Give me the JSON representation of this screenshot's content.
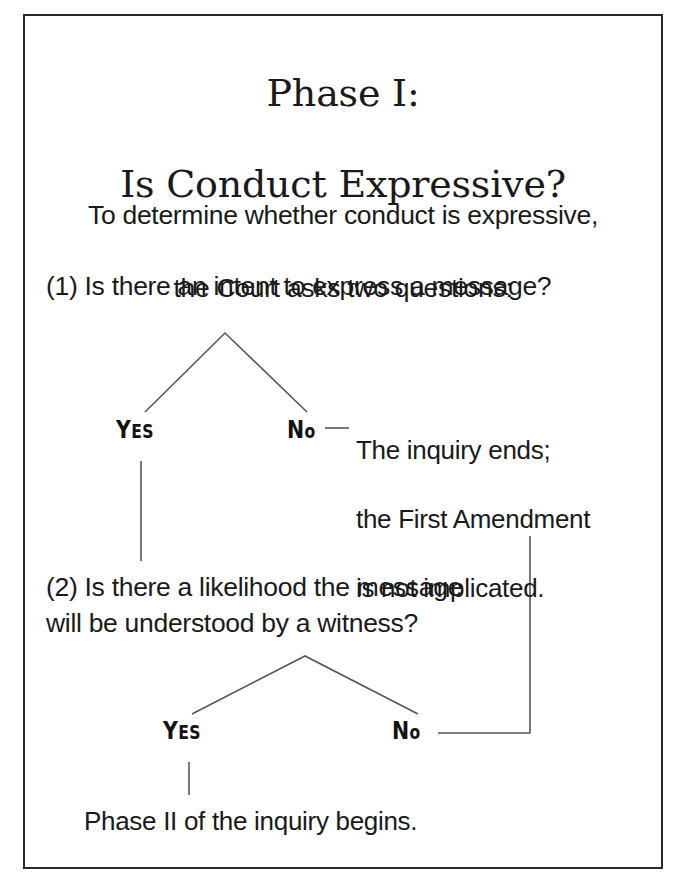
{
  "document": {
    "type": "flowchart",
    "title_line_1": "Phase I:",
    "title_line_2": "Is Conduct Expressive?",
    "intro_line_1": "To determine whether conduct is expressive,",
    "intro_line_2": "the Court asks two questions:",
    "border_color": "#2a2a2a",
    "text_color": "#1a1a1a",
    "connector_color": "#55555c",
    "background_color": "#ffffff"
  },
  "nodes": {
    "question_1": "(1) Is there an intent to express a message?",
    "question_2": "(2) Is there a likelihood the message\nwill be understood by a witness?",
    "outcome_no_1_line_1": "The inquiry ends;",
    "outcome_no_1_line_2": "the First Amendment",
    "outcome_no_1_line_3": "is not implicated.",
    "outcome_final": "Phase II of the inquiry begins."
  },
  "branch_labels": {
    "yes_1_full": "YES",
    "yes_1_cap": "Y",
    "yes_1_rest": "ES",
    "no_1_full": "No",
    "no_1_cap": "N",
    "no_1_rest": "o",
    "yes_2_full": "YES",
    "yes_2_cap": "Y",
    "yes_2_rest": "ES",
    "no_2_full": "No",
    "no_2_cap": "N",
    "no_2_rest": "o"
  }
}
